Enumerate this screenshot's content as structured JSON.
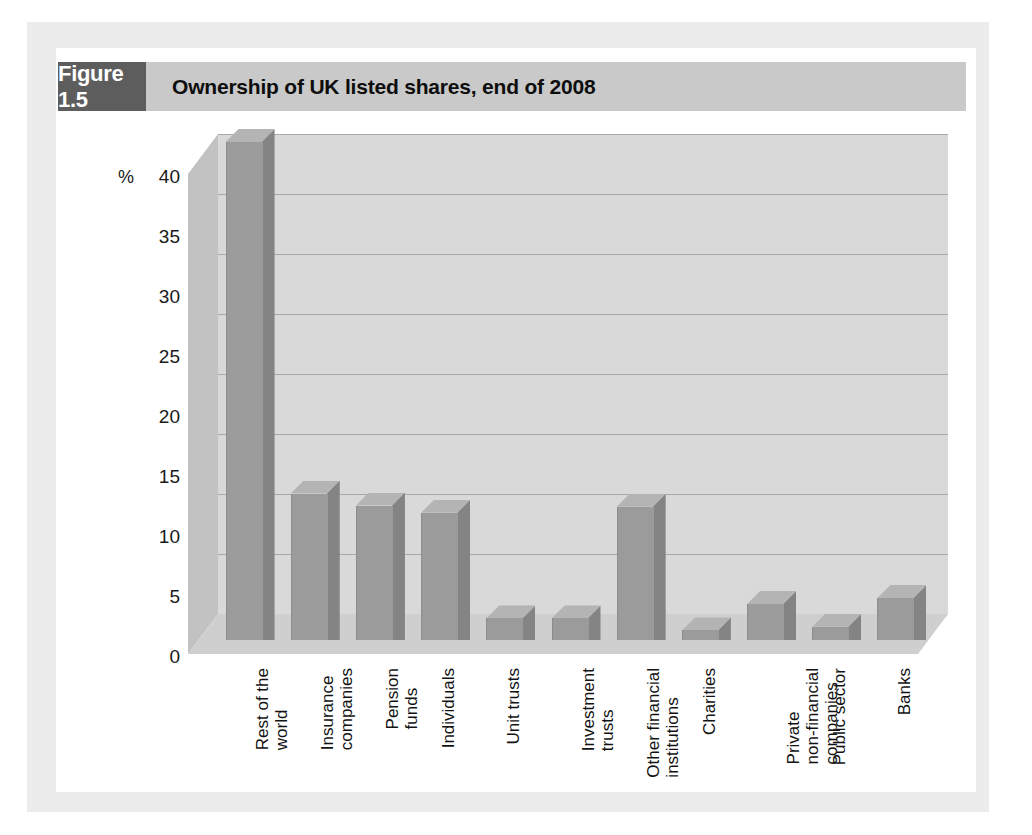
{
  "figure": {
    "tag": "Figure 1.5",
    "title": "Ownership of UK listed shares, end of 2008"
  },
  "colors": {
    "tag_background": "#5d5d5d",
    "header_background": "#c9c9c9",
    "bar_front": "#9b9b9c",
    "bar_side": "#848485",
    "bar_top": "#b4b4b5",
    "plot_backwall": "#d9d9da",
    "gridline": "#a9a9aa",
    "paper": "#ececed"
  },
  "chart_data": {
    "type": "bar",
    "title": "Ownership of UK listed shares, end of 2008",
    "xlabel": "",
    "ylabel": "%",
    "ylim": [
      0,
      40
    ],
    "yticks": [
      0,
      5,
      10,
      15,
      20,
      25,
      30,
      35,
      40
    ],
    "grid": true,
    "legend": "none",
    "three_d": true,
    "categories": [
      "Rest of the world",
      "Insurance companies",
      "Pension funds",
      "Individuals",
      "Unit trusts",
      "Investment trusts",
      "Other financial institutions",
      "Charities",
      "Private non-financial companies",
      "Public sector",
      "Banks"
    ],
    "category_lines": [
      [
        "Rest of the",
        "world"
      ],
      [
        "Insurance",
        "companies"
      ],
      [
        "Pension",
        "funds"
      ],
      [
        "Individuals"
      ],
      [
        "Unit trusts"
      ],
      [
        "Investment",
        "trusts"
      ],
      [
        "Other financial",
        "institutions"
      ],
      [
        "Charities"
      ],
      [
        "Private",
        "non-financial",
        "companies"
      ],
      [
        "Public sector"
      ],
      [
        "Banks"
      ]
    ],
    "values": [
      41.5,
      12.2,
      11.2,
      10.6,
      1.8,
      1.8,
      11.1,
      0.8,
      3.0,
      1.1,
      3.5
    ]
  }
}
